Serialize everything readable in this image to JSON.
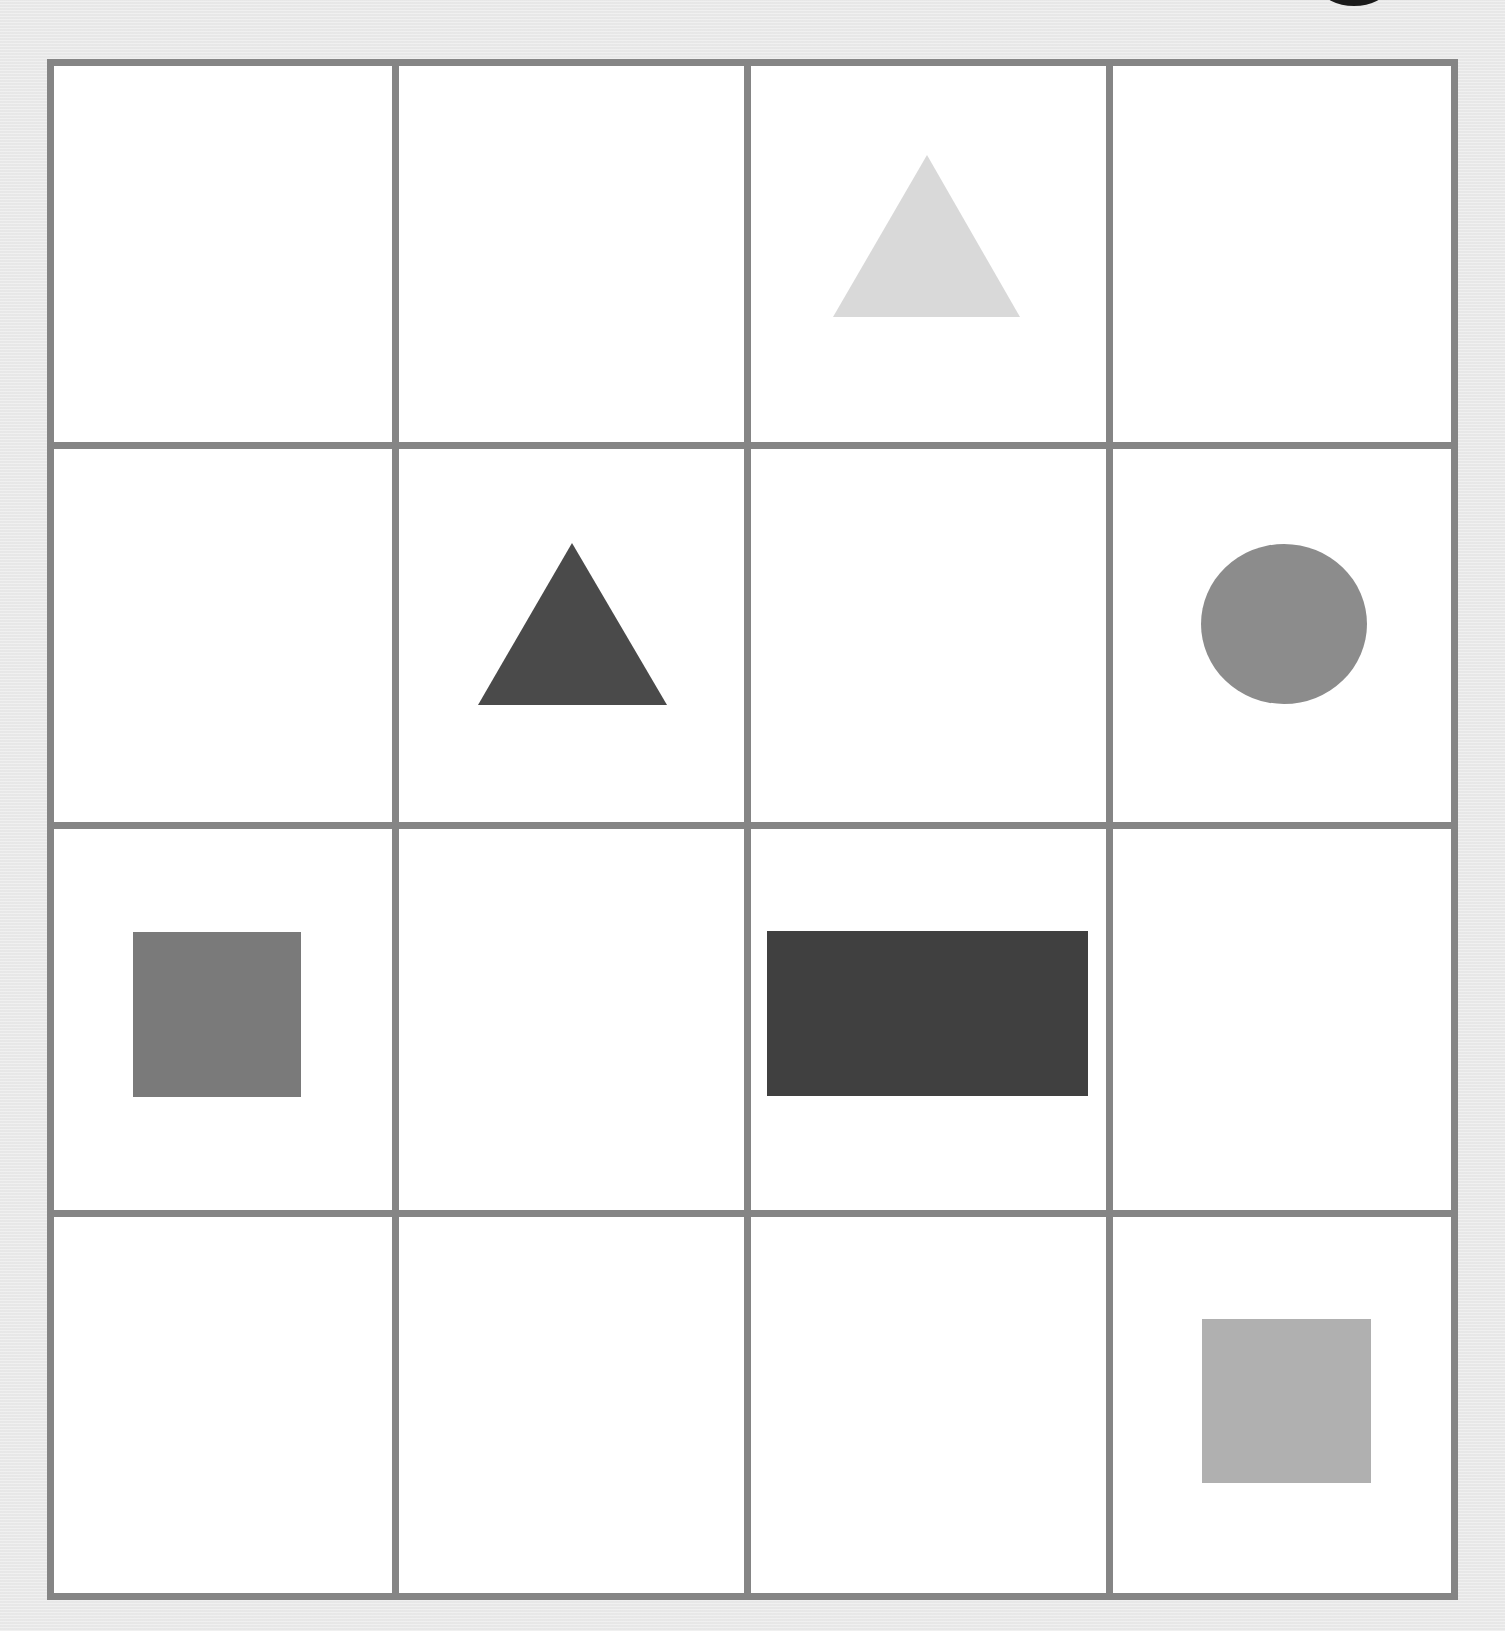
{
  "figure": {
    "type": "shape-grid-puzzle",
    "rows": 4,
    "cols": 4,
    "background_color": "#ebebeb",
    "cell_color": "#ffffff",
    "grid_line_color": "#858585",
    "frame": {
      "x": 47,
      "y": 59,
      "width": 1411,
      "height": 1541,
      "line_width": 7
    },
    "column_lines_x": [
      47,
      392,
      744,
      1106,
      1451
    ],
    "row_lines_y": [
      59,
      442,
      822,
      1210,
      1593
    ],
    "corner_mark": {
      "shape": "ellipse",
      "color": "#1a1a1a"
    }
  },
  "cells": [
    {
      "row": 0,
      "col": 0,
      "shape": "empty"
    },
    {
      "row": 0,
      "col": 1,
      "shape": "empty"
    },
    {
      "row": 0,
      "col": 2,
      "shape": "triangle",
      "color": "#d9d9d9",
      "points": "927,155 833,317 1020,317"
    },
    {
      "row": 0,
      "col": 3,
      "shape": "empty"
    },
    {
      "row": 1,
      "col": 0,
      "shape": "empty"
    },
    {
      "row": 1,
      "col": 1,
      "shape": "triangle",
      "color": "#4a4a4a",
      "points": "572,543 478,705 667,705"
    },
    {
      "row": 1,
      "col": 2,
      "shape": "empty"
    },
    {
      "row": 1,
      "col": 3,
      "shape": "circle",
      "color": "#8c8c8c",
      "cx": 1284,
      "cy": 624,
      "rx": 83,
      "ry": 80
    },
    {
      "row": 2,
      "col": 0,
      "shape": "square",
      "color": "#7a7a7a",
      "x": 133,
      "y": 932,
      "width": 168,
      "height": 165
    },
    {
      "row": 2,
      "col": 1,
      "shape": "empty"
    },
    {
      "row": 2,
      "col": 2,
      "shape": "rectangle",
      "color": "#404040",
      "x": 767,
      "y": 931,
      "width": 321,
      "height": 165
    },
    {
      "row": 2,
      "col": 3,
      "shape": "empty"
    },
    {
      "row": 3,
      "col": 0,
      "shape": "empty"
    },
    {
      "row": 3,
      "col": 1,
      "shape": "empty"
    },
    {
      "row": 3,
      "col": 2,
      "shape": "empty"
    },
    {
      "row": 3,
      "col": 3,
      "shape": "square",
      "color": "#b0b0b0",
      "x": 1202,
      "y": 1319,
      "width": 169,
      "height": 164
    }
  ]
}
